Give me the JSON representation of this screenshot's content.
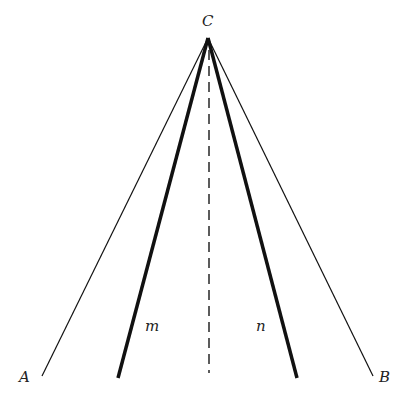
{
  "diagram": {
    "type": "geometry-lines",
    "apex": {
      "label": "C",
      "x": 208,
      "y": 38
    },
    "points": [
      {
        "label": "A",
        "x": 22,
        "y": 381
      },
      {
        "label": "B",
        "x": 378,
        "y": 381
      }
    ],
    "lines": [
      {
        "name": "CA",
        "x2": 42,
        "y2": 376,
        "weight": "thin"
      },
      {
        "name": "CB",
        "x2": 373,
        "y2": 376,
        "weight": "thin"
      },
      {
        "name": "m",
        "label": "m",
        "x2": 118,
        "y2": 378,
        "weight": "thick",
        "label_x": 146,
        "label_y": 330
      },
      {
        "name": "n",
        "label": "n",
        "x2": 297,
        "y2": 378,
        "weight": "thick",
        "label_x": 258,
        "label_y": 330
      },
      {
        "name": "altitude",
        "x2": 209,
        "y2": 373,
        "weight": "dashed"
      }
    ],
    "colors": {
      "stroke": "#111111",
      "text": "#222222",
      "background": "#ffffff"
    }
  }
}
